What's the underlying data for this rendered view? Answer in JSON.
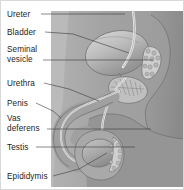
{
  "figure": {
    "view": "sagittal cross-section",
    "background_color": "#ffffff",
    "border_color": "#d8d8d8",
    "illustration_panel": {
      "fill_color": "#a8a8a8",
      "x": 50,
      "y": 10,
      "width": 134,
      "height": 176
    },
    "palette": {
      "body_tissue": "#9e9e9e",
      "body_tissue_light": "#b4b4b4",
      "organ_light": "#c9c9c9",
      "organ_mid": "#b0b0b0",
      "organ_dark": "#8b8b8b",
      "duct_white": "#ececec",
      "outline": "#6f6f6f",
      "leader_line": "#3a3a3a",
      "text": "#1d1d1d"
    }
  },
  "labels": [
    {
      "id": "ureter",
      "text": "Ureter",
      "text_x": 6,
      "text_y": 16,
      "leader": "M 40 13 L 86 13 L 124 13",
      "points_to": "ureter tube descending from kidney into bladder"
    },
    {
      "id": "bladder",
      "text": "Bladder",
      "text_x": 6,
      "text_y": 34,
      "leader": "M 44 31 L 72 33 L 128 52",
      "points_to": "urinary bladder"
    },
    {
      "id": "seminal-vesicle-line1",
      "text": "Seminal",
      "text_x": 6,
      "text_y": 51,
      "leader": "",
      "points_to": ""
    },
    {
      "id": "seminal-vesicle-line2",
      "text": "vesicle",
      "text_x": 6,
      "text_y": 61,
      "leader": "M 42 59 L 100 59 L 152 59",
      "points_to": "seminal vesicle"
    },
    {
      "id": "urethra",
      "text": "Urethra",
      "text_x": 6,
      "text_y": 85,
      "leader": "M 43 82 L 68 88 L 98 100",
      "points_to": "urethra running through penis"
    },
    {
      "id": "penis",
      "text": "Penis",
      "text_x": 6,
      "text_y": 105,
      "leader": "M 35 102 L 52 110 L 60 117",
      "points_to": "penis shaft"
    },
    {
      "id": "vas-deferens-line1",
      "text": "Vas",
      "text_x": 6,
      "text_y": 120,
      "leader": "",
      "points_to": ""
    },
    {
      "id": "vas-deferens-line2",
      "text": "deferens",
      "text_x": 6,
      "text_y": 130,
      "leader": "M 46 128 L 100 128 L 150 128",
      "points_to": "vas deferens duct"
    },
    {
      "id": "testis",
      "text": "Testis",
      "text_x": 6,
      "text_y": 149,
      "leader": "M 35 146 L 86 146 L 134 146",
      "points_to": "testis"
    },
    {
      "id": "epididymis",
      "text": "Epididymis",
      "text_x": 6,
      "text_y": 178,
      "leader": "M 52 175 L 78 168 L 106 152",
      "points_to": "epididymis on posterior testis"
    }
  ],
  "structures": [
    {
      "id": "bladder-organ",
      "name": "Bladder",
      "shape": "ellipse"
    },
    {
      "id": "seminal-vesicle-organ",
      "name": "Seminal vesicle",
      "shape": "lobulated-mass"
    },
    {
      "id": "prostate-organ",
      "name": "Prostate",
      "shape": "rounded-mass-with-striations"
    },
    {
      "id": "penis-organ",
      "name": "Penis",
      "shape": "curved-shaft"
    },
    {
      "id": "urethra-duct",
      "name": "Urethra",
      "shape": "tube"
    },
    {
      "id": "ureter-duct",
      "name": "Ureter",
      "shape": "tube"
    },
    {
      "id": "vas-deferens-duct",
      "name": "Vas deferens",
      "shape": "tube"
    },
    {
      "id": "testis-organ",
      "name": "Testis",
      "shape": "ellipse"
    },
    {
      "id": "epididymis-organ",
      "name": "Epididymis",
      "shape": "crescent-lobulated"
    },
    {
      "id": "rectum-organ",
      "name": "Rectum",
      "shape": "tubular-mass"
    },
    {
      "id": "pubic-bone",
      "name": "Pubic bone",
      "shape": "rounded-block"
    },
    {
      "id": "scrotum",
      "name": "Scrotum",
      "shape": "sac"
    }
  ]
}
